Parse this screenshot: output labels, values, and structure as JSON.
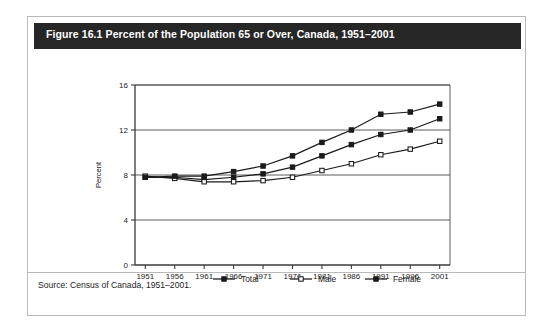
{
  "figure": {
    "title": "Figure 16.1 Percent of the Population 65 or Over, Canada, 1951–2001",
    "source": "Source: Census of Canada, 1951–2001."
  },
  "colors": {
    "title_bar_background": "#262626",
    "title_text": "#ffffff",
    "page_background": "#ffffff",
    "border": "#b9b9b9",
    "axis": "#3a3a3a",
    "gridline": "#4a4a4a",
    "series_line": "#1a1a1a",
    "marker_fill_solid": "#1a1a1a",
    "marker_fill_open": "#ffffff"
  },
  "chart_data": {
    "type": "line",
    "title": "Figure 16.1 Percent of the Population 65 or Over, Canada, 1951–2001",
    "xlabel": "",
    "ylabel": "Percent",
    "categories": [
      "1951",
      "1956",
      "1961",
      "1966",
      "1971",
      "1976",
      "1981",
      "1986",
      "1991",
      "1996",
      "2001"
    ],
    "x": [
      1951,
      1956,
      1961,
      1966,
      1971,
      1976,
      1981,
      1986,
      1991,
      1996,
      2001
    ],
    "xlim": [
      1949,
      2003
    ],
    "ylim": [
      0,
      16
    ],
    "yticks": [
      0,
      4,
      8,
      12,
      16
    ],
    "grid": true,
    "legend_position": "bottom",
    "series": [
      {
        "name": "Total",
        "marker": "filled-square",
        "values": [
          7.8,
          7.8,
          7.6,
          7.8,
          8.1,
          8.7,
          9.7,
          10.7,
          11.6,
          12.0,
          13.0
        ]
      },
      {
        "name": "Male",
        "marker": "open-square",
        "values": [
          7.9,
          7.7,
          7.4,
          7.4,
          7.5,
          7.8,
          8.4,
          9.0,
          9.8,
          10.3,
          11.0
        ]
      },
      {
        "name": "Female",
        "marker": "filled-square",
        "values": [
          7.8,
          7.9,
          7.9,
          8.3,
          8.8,
          9.7,
          10.9,
          12.0,
          13.4,
          13.6,
          14.3
        ]
      }
    ]
  },
  "legend": {
    "items": [
      {
        "label": "Total",
        "marker": "filled-square"
      },
      {
        "label": "Male",
        "marker": "open-square"
      },
      {
        "label": "Female",
        "marker": "filled-square"
      }
    ]
  },
  "axes": {
    "y_title": "Percent",
    "y_tick_labels": [
      "0",
      "4",
      "8",
      "12",
      "16"
    ],
    "x_tick_labels": [
      "1951",
      "1956",
      "1961",
      "1966",
      "1971",
      "1976",
      "1981",
      "1986",
      "1991",
      "1996",
      "2001"
    ]
  }
}
